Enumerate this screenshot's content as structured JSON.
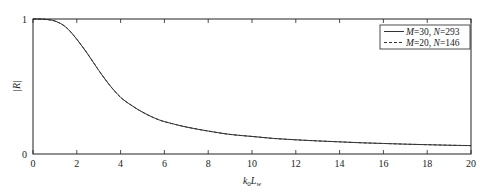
{
  "chart_data": {
    "type": "line",
    "title": "",
    "xlabel": "k0Lw",
    "xlabel_parts": {
      "main": "k",
      "sub1": "0",
      "main2": "L",
      "sub2": "w"
    },
    "ylabel": "|R|",
    "xlim": [
      0,
      20
    ],
    "ylim": [
      0,
      1
    ],
    "xticks": [
      0,
      2,
      4,
      6,
      8,
      10,
      12,
      14,
      16,
      18,
      20
    ],
    "yticks": [
      0,
      1
    ],
    "ytick_labels": [
      "0",
      "1"
    ],
    "grid": false,
    "legend_position": "upper right",
    "x": [
      0,
      0.5,
      1,
      1.5,
      2,
      2.5,
      3,
      3.5,
      4,
      4.5,
      5,
      5.5,
      6,
      7,
      8,
      9,
      10,
      11,
      12,
      13,
      14,
      15,
      16,
      17,
      18,
      19,
      20
    ],
    "series": [
      {
        "name": "M=30, N=293",
        "label_parts": {
          "a": "M",
          "av": "=30, ",
          "b": "N",
          "bv": "=293"
        },
        "style": "solid",
        "values": [
          1.0,
          0.998,
          0.985,
          0.94,
          0.85,
          0.74,
          0.62,
          0.51,
          0.42,
          0.36,
          0.31,
          0.27,
          0.24,
          0.2,
          0.17,
          0.145,
          0.13,
          0.115,
          0.105,
          0.097,
          0.09,
          0.083,
          0.078,
          0.073,
          0.069,
          0.065,
          0.062
        ]
      },
      {
        "name": "M=20, N=146",
        "label_parts": {
          "a": "M",
          "av": "=20, ",
          "b": "N",
          "bv": "=146"
        },
        "style": "dashed",
        "values": [
          1.0,
          0.998,
          0.985,
          0.94,
          0.85,
          0.74,
          0.62,
          0.51,
          0.42,
          0.36,
          0.31,
          0.27,
          0.24,
          0.2,
          0.17,
          0.145,
          0.13,
          0.115,
          0.105,
          0.097,
          0.09,
          0.083,
          0.078,
          0.073,
          0.069,
          0.065,
          0.062
        ]
      }
    ],
    "colors": {
      "line": "#333333",
      "axis": "#222222"
    }
  }
}
